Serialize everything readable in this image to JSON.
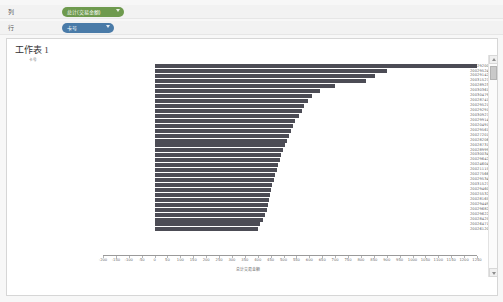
{
  "shelves": {
    "columns": {
      "label": "列",
      "pill": "总计(交易金额)",
      "pill_type": "measure"
    },
    "rows": {
      "label": "行",
      "pill": "卡号",
      "pill_type": "dimension"
    }
  },
  "worksheet": {
    "title": "工作表 1"
  },
  "scrollbar": {
    "up_icon": "chevron-up-icon",
    "down_icon": "chevron-down-icon"
  },
  "chart_data": {
    "type": "bar",
    "orientation": "horizontal",
    "title": "工作表 1",
    "xlabel": "总计交易金额",
    "ylabel": "卡号",
    "xlim": [
      -200,
      1250
    ],
    "xticks": [
      -200,
      -150,
      -100,
      -50,
      0,
      50,
      100,
      150,
      200,
      250,
      300,
      350,
      400,
      450,
      500,
      550,
      600,
      650,
      700,
      750,
      800,
      850,
      900,
      950,
      1000,
      1050,
      1100,
      1150,
      1200,
      1250
    ],
    "grid": false,
    "legend": null,
    "bar_color": "#4c4c55",
    "categories": [
      "20029200",
      "20029524",
      "20029142",
      "20031527",
      "20028923",
      "20030361",
      "20030479",
      "20028741",
      "20029521",
      "20029291",
      "20030927",
      "20029914",
      "20020491",
      "20029561",
      "20027201",
      "20028206",
      "20028731",
      "20028999",
      "20030034",
      "20029642",
      "20024604",
      "20021115",
      "20027566",
      "20029534",
      "20031527",
      "20029460",
      "20025532",
      "20028165",
      "20029449",
      "20029682",
      "20029622",
      "20028425",
      "20026471",
      "20026120"
    ],
    "values": [
      1250,
      900,
      855,
      820,
      700,
      640,
      610,
      595,
      580,
      570,
      560,
      545,
      535,
      530,
      520,
      512,
      505,
      498,
      492,
      486,
      480,
      474,
      468,
      462,
      456,
      450,
      446,
      442,
      438,
      434,
      430,
      420,
      410,
      400
    ],
    "xaxis_label": "总计交易金额"
  }
}
